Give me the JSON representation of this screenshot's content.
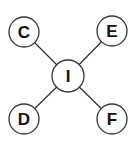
{
  "diagram": {
    "type": "star-graph",
    "center": {
      "id": "I",
      "label": "I",
      "x": 68,
      "y": 76,
      "r": 16
    },
    "nodes": [
      {
        "id": "C",
        "label": "C",
        "x": 24,
        "y": 32,
        "r": 15
      },
      {
        "id": "E",
        "label": "E",
        "x": 112,
        "y": 31,
        "r": 15
      },
      {
        "id": "D",
        "label": "D",
        "x": 24,
        "y": 119,
        "r": 15
      },
      {
        "id": "F",
        "label": "F",
        "x": 112,
        "y": 119,
        "r": 15
      }
    ],
    "edges": [
      {
        "from": "I",
        "to": "C"
      },
      {
        "from": "I",
        "to": "E"
      },
      {
        "from": "I",
        "to": "D"
      },
      {
        "from": "I",
        "to": "F"
      }
    ],
    "colors": {
      "stroke": "#333333",
      "fill": "#ffffff",
      "text": "#111111"
    }
  }
}
